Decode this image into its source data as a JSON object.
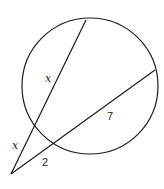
{
  "diagram": {
    "type": "secant-secant geometry figure",
    "circle": {
      "cx": 90,
      "cy": 86,
      "r": 68
    },
    "external_point": {
      "x": 11,
      "y": 174
    },
    "secant_1": {
      "end": {
        "x": 86,
        "y": 20
      },
      "external_segment_label": "x",
      "internal_segment_label": "x"
    },
    "secant_2": {
      "end": {
        "x": 155,
        "y": 70
      },
      "external_segment_label": "2",
      "internal_segment_label": "7"
    },
    "labels": [
      {
        "id": "secant1-internal",
        "text": "x",
        "x": 45,
        "y": 73
      },
      {
        "id": "secant1-external",
        "text": "x",
        "x": 12,
        "y": 140
      },
      {
        "id": "secant2-internal",
        "text": "7",
        "x": 107,
        "y": 111
      },
      {
        "id": "secant2-external",
        "text": "2",
        "x": 42,
        "y": 157
      }
    ],
    "stroke_color": "#1a1a1a"
  }
}
